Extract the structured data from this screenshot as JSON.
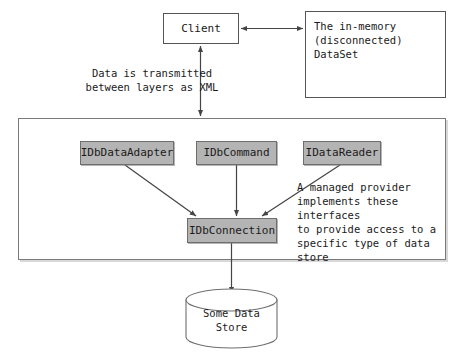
{
  "diagram": {
    "colors": {
      "interface_fill": "#b4b4b4",
      "interface_border": "#6e6e6e",
      "box_border": "#555555",
      "container_border": "#7a7a7a",
      "background": "#ffffff",
      "text": "#1a1a1a",
      "arrow": "#444444"
    },
    "client_box": {
      "label": "Client"
    },
    "dataset_box": {
      "label": "The in-memory\n(disconnected)\nDataSet",
      "icon": "database-cylinder-icon"
    },
    "xml_caption": {
      "text": "Data is transmitted\nbetween layers as XML"
    },
    "provider_caption": {
      "text": "A managed provider\nimplements these interfaces\nto provide access to a\nspecific type of data store"
    },
    "interfaces": [
      {
        "label": "IDbDataAdapter"
      },
      {
        "label": "IDbCommand"
      },
      {
        "label": "IDataReader"
      }
    ],
    "connection_box": {
      "label": "IDbConnection"
    },
    "data_store": {
      "label": "Some Data\nStore",
      "icon": "database-cylinder-icon"
    },
    "arrows": [
      {
        "name": "client-to-dataset",
        "kind": "double-headed-horizontal"
      },
      {
        "name": "client-to-provider",
        "kind": "double-headed-vertical"
      },
      {
        "name": "adapter-to-connection",
        "kind": "single-headed-diagonal"
      },
      {
        "name": "command-to-connection",
        "kind": "single-headed-vertical"
      },
      {
        "name": "reader-to-connection",
        "kind": "single-headed-diagonal"
      },
      {
        "name": "connection-to-datastore",
        "kind": "single-headed-vertical"
      }
    ]
  }
}
